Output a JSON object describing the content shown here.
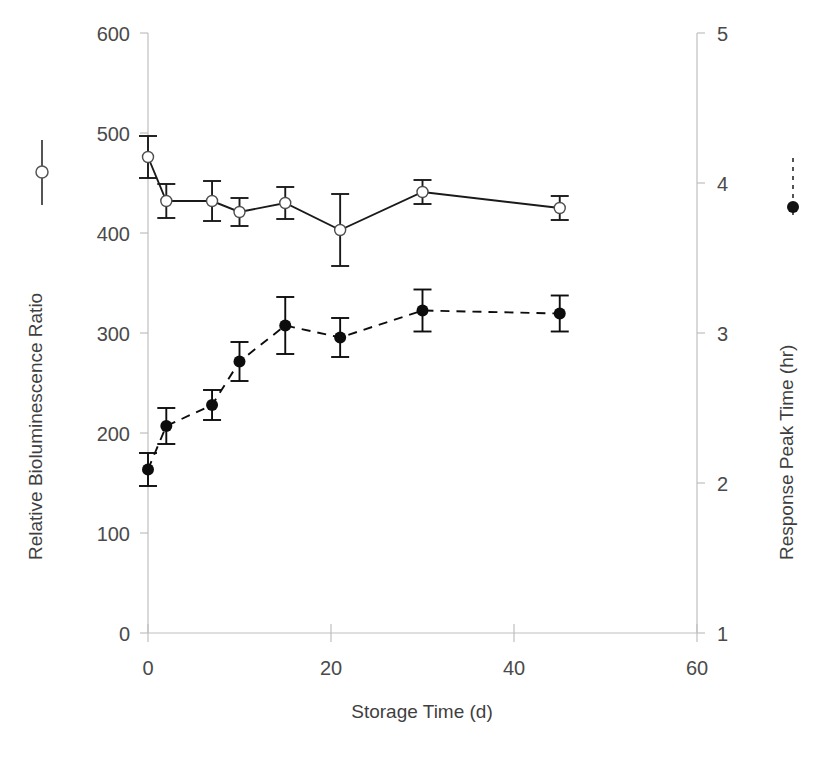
{
  "chart_data": {
    "type": "line",
    "title": "",
    "xlabel": "Storage Time (d)",
    "ylabel": "Relative Bioluminescence Ratio",
    "y2label": "Response Peak Time (hr)",
    "xlim": [
      0,
      60
    ],
    "ylim": [
      0,
      600
    ],
    "y2lim": [
      1,
      5
    ],
    "xticks": [
      0,
      20,
      40,
      60
    ],
    "yticks": [
      0,
      100,
      200,
      300,
      400,
      500,
      600
    ],
    "y2ticks": [
      1,
      2,
      3,
      4,
      5
    ],
    "grid": false,
    "legend_position": "axis-titles",
    "x": [
      0,
      2,
      7,
      10,
      15,
      21,
      30,
      45
    ],
    "series": [
      {
        "name": "Relative Bioluminescence Ratio",
        "axis": "left",
        "linestyle": "solid",
        "marker": "open-circle",
        "color": "#1a1a1a",
        "values": [
          476,
          432,
          432,
          421,
          430,
          403,
          441,
          425
        ],
        "errors": [
          21,
          17,
          20,
          14,
          16,
          36,
          12,
          12
        ]
      },
      {
        "name": "Response Peak Time (hr)",
        "axis": "right",
        "linestyle": "dashed",
        "marker": "filled-circle",
        "color": "#0d0d0d",
        "values": [
          2.09,
          2.38,
          2.52,
          2.81,
          3.05,
          2.97,
          3.15,
          3.13
        ],
        "errors": [
          0.11,
          0.12,
          0.1,
          0.13,
          0.19,
          0.13,
          0.14,
          0.12
        ]
      }
    ]
  },
  "axes": {
    "x_title": "Storage Time (d)",
    "y_left_title": "Relative Bioluminescence Ratio",
    "y_right_title": "Response Peak Time (hr)",
    "x_tick_labels": [
      "0",
      "20",
      "40",
      "60"
    ],
    "y_left_tick_labels": [
      "0",
      "100",
      "200",
      "300",
      "400",
      "500",
      "600"
    ],
    "y_right_tick_labels": [
      "1",
      "2",
      "3",
      "4",
      "5"
    ]
  },
  "legend": {
    "left_marker": "open-circle-solid-line",
    "right_marker": "filled-circle-dashed-line"
  },
  "colors": {
    "axis": "#bfbfbf",
    "tick_text": "#4a4a4a",
    "series_left": "#1a1a1a",
    "series_right": "#0d0d0d",
    "background": "#ffffff"
  }
}
